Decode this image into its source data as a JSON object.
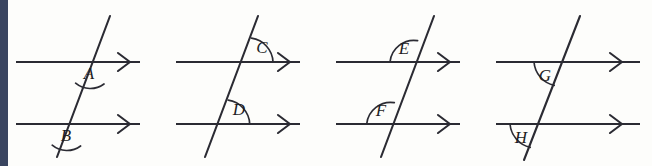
{
  "figure": {
    "background_color": "#fdfdfb",
    "ink_color": "#2b2b33",
    "edge_bar_color": "#3a4560",
    "line_count_per_panel": 2,
    "arrowhead_glyph": "chevron-right",
    "panels": [
      {
        "id": "panel-1",
        "angles": [
          {
            "label": "A",
            "position": "below-line-right-of-transversal",
            "on_line": "top"
          },
          {
            "label": "B",
            "position": "below-line-right-of-transversal",
            "on_line": "bottom"
          }
        ]
      },
      {
        "id": "panel-2",
        "angles": [
          {
            "label": "C",
            "position": "above-line-right-of-transversal",
            "on_line": "top"
          },
          {
            "label": "D",
            "position": "above-line-right-of-transversal",
            "on_line": "bottom"
          }
        ]
      },
      {
        "id": "panel-3",
        "angles": [
          {
            "label": "E",
            "position": "above-line-left-of-transversal",
            "on_line": "top"
          },
          {
            "label": "F",
            "position": "above-line-left-of-transversal",
            "on_line": "bottom"
          }
        ]
      },
      {
        "id": "panel-4",
        "angles": [
          {
            "label": "G",
            "position": "below-line-left-of-transversal",
            "on_line": "top"
          },
          {
            "label": "H",
            "position": "below-line-left-of-transversal",
            "on_line": "bottom"
          }
        ]
      }
    ]
  }
}
